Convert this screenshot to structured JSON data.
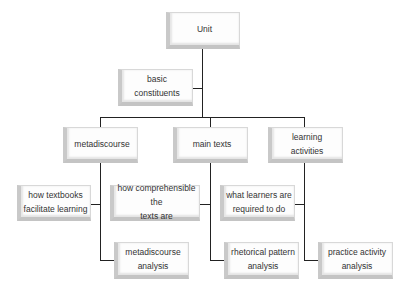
{
  "diagram": {
    "root": {
      "label": "Unit"
    },
    "basic": {
      "line1": "basic",
      "line2": "constituents"
    },
    "categories": [
      {
        "label": [
          "metadiscourse"
        ],
        "question": [
          "how textbooks",
          "facilitate learning"
        ],
        "analysis": [
          "metadiscourse",
          "analysis"
        ]
      },
      {
        "label": [
          "main texts"
        ],
        "question": [
          "how comprehensible the",
          "texts are"
        ],
        "analysis": [
          "rhetorical pattern",
          "analysis"
        ]
      },
      {
        "label": [
          "learning",
          "activities"
        ],
        "question": [
          "what learners are",
          "required to do"
        ],
        "analysis": [
          "practice activity",
          "analysis"
        ]
      }
    ]
  }
}
